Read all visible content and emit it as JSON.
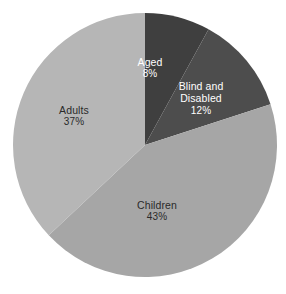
{
  "chart_data": {
    "type": "pie",
    "title": "",
    "subtitle": "",
    "xlabel": "",
    "ylabel": "",
    "legend": "none",
    "grid": false,
    "value_unit": "%",
    "start_angle_deg": 0,
    "direction": "clockwise",
    "categories": [
      "Aged",
      "Blind and Disabled",
      "Children",
      "Adults"
    ],
    "values": [
      8,
      12,
      43,
      37
    ],
    "slices": [
      {
        "label": "Aged",
        "label_line1": "Aged",
        "label_line2": "",
        "value": 8,
        "value_text": "8%",
        "color": "#3f3f3f",
        "text_color": "#ffffff"
      },
      {
        "label": "Blind and Disabled",
        "label_line1": "Blind and",
        "label_line2": "Disabled",
        "value": 12,
        "value_text": "12%",
        "color": "#4d4d4d",
        "text_color": "#ffffff"
      },
      {
        "label": "Children",
        "label_line1": "Children",
        "label_line2": "",
        "value": 43,
        "value_text": "43%",
        "color": "#a6a6a6",
        "text_color": "#2a2a2a"
      },
      {
        "label": "Adults",
        "label_line1": "Adults",
        "label_line2": "",
        "value": 37,
        "value_text": "37%",
        "color": "#b6b6b6",
        "text_color": "#2a2a2a"
      }
    ]
  },
  "figure": {
    "background_color": "#ffffff",
    "center_x": 145,
    "center_y": 145,
    "radius": 132
  }
}
